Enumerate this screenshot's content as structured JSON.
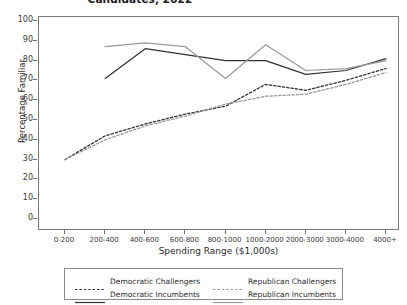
{
  "chart_data": {
    "type": "line",
    "title": "Candidates, 2022",
    "xlabel": "Spending Range ($1,000s)",
    "ylabel": "Percentage Familiar",
    "categories": [
      "0-200",
      "200-400",
      "400-600",
      "600-800",
      "800-1000",
      "1000-2000",
      "2000-3000",
      "3000-4000",
      "4000+"
    ],
    "ylim": [
      0,
      100
    ],
    "yticks": [
      0,
      10,
      20,
      30,
      40,
      50,
      60,
      70,
      80,
      90,
      100
    ],
    "grid": false,
    "legend_position": "below",
    "series": [
      {
        "name": "Democratic Challengers",
        "style": "dashed",
        "color": "#333333",
        "values": [
          30,
          42,
          48,
          53,
          57,
          68,
          65,
          70,
          76
        ]
      },
      {
        "name": "Republican Challengers",
        "style": "dashed",
        "color": "#999999",
        "values": [
          30,
          40,
          47,
          52,
          58,
          62,
          63,
          68,
          74
        ]
      },
      {
        "name": "Democratic Incumbents",
        "style": "solid",
        "color": "#333333",
        "values": [
          null,
          71,
          86,
          83,
          80,
          80,
          73,
          75,
          81
        ]
      },
      {
        "name": "Republican Incumbents",
        "style": "solid",
        "color": "#999999",
        "values": [
          null,
          87,
          89,
          87,
          71,
          88,
          75,
          76,
          80
        ]
      }
    ]
  },
  "legend": {
    "entries": [
      {
        "label": "Democratic Challengers"
      },
      {
        "label": "Republican Challengers"
      },
      {
        "label": "Democratic Incumbents"
      },
      {
        "label": "Republican Incumbents"
      }
    ]
  },
  "yticks_text": [
    "100",
    "90",
    "80",
    "70",
    "60",
    "50",
    "40",
    "30",
    "20",
    "10",
    "0"
  ]
}
